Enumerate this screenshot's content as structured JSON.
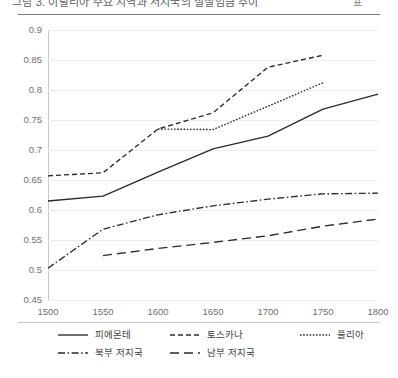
{
  "header": {
    "title_clipped": "그림 3. 이탈리아 주요 지역과 저지국의 실질임금 추이",
    "badge": "표"
  },
  "chart_data": {
    "type": "line",
    "title": "",
    "xlabel": "",
    "ylabel": "",
    "x": [
      1500,
      1550,
      1600,
      1650,
      1700,
      1750,
      1800
    ],
    "xlim": [
      1500,
      1800
    ],
    "ylim": [
      0.45,
      0.9
    ],
    "xticks": [
      "1500",
      "1550",
      "1600",
      "1650",
      "1700",
      "1750",
      "1800"
    ],
    "yticks": [
      "0.45",
      "0.5",
      "0.55",
      "0.6",
      "0.65",
      "0.7",
      "0.75",
      "0.8",
      "0.85",
      "0.9"
    ],
    "grid": true,
    "legend_position": "bottom",
    "series": [
      {
        "name": "피에몬테",
        "style": "solid",
        "dash": "none",
        "x": [
          1500,
          1550,
          1600,
          1650,
          1700,
          1750,
          1800
        ],
        "values": [
          0.615,
          0.623,
          0.663,
          0.702,
          0.723,
          0.768,
          0.793
        ]
      },
      {
        "name": "토스카나",
        "style": "dashed",
        "dash": "5,3",
        "x": [
          1500,
          1550,
          1600,
          1650,
          1700,
          1750
        ],
        "values": [
          0.657,
          0.662,
          0.735,
          0.762,
          0.838,
          0.858
        ]
      },
      {
        "name": "풀리아",
        "style": "dotted",
        "dash": "1.6,1.6",
        "x": [
          1600,
          1650,
          1700,
          1750
        ],
        "values": [
          0.735,
          0.734,
          0.773,
          0.812
        ]
      },
      {
        "name": "북부 저지국",
        "style": "dash-dot",
        "dash": "7,2.5,1.6,2.5",
        "x": [
          1500,
          1550,
          1600,
          1650,
          1700,
          1750,
          1800
        ],
        "values": [
          0.503,
          0.568,
          0.592,
          0.607,
          0.618,
          0.627,
          0.628
        ]
      },
      {
        "name": "남부 저지국",
        "style": "long-dash",
        "dash": "9,5",
        "x": [
          1550,
          1600,
          1650,
          1700,
          1750,
          1800
        ],
        "values": [
          0.524,
          0.536,
          0.546,
          0.557,
          0.573,
          0.585
        ]
      }
    ]
  },
  "legend": {
    "rows": [
      [
        {
          "label": "피에몬테",
          "dash": "none"
        },
        {
          "label": "토스카나",
          "dash": "5,3"
        },
        {
          "label": "풀리아",
          "dash": "1.6,1.6"
        }
      ],
      [
        {
          "label": "북부 저지국",
          "dash": "7,2.5,1.6,2.5"
        },
        {
          "label": "남부 저지국",
          "dash": "9,5"
        }
      ]
    ]
  }
}
